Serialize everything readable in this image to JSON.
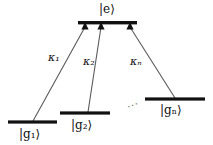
{
  "figure": {
    "type": "energy-level-diagram",
    "background_color": "#ffffff",
    "line_color": "#555555",
    "level_color": "#111111",
    "text_color": "#0d0d0d"
  },
  "levels": [
    {
      "id": "excited",
      "label_prefix": "|",
      "label_symbol": "e",
      "label_sub": "",
      "label_suffix": "⟩",
      "label_text": "|e⟩",
      "x1": 78,
      "x2": 137,
      "y": 23,
      "label_x": 99,
      "label_y": 4
    },
    {
      "id": "ground-1",
      "label_prefix": "|",
      "label_symbol": "g",
      "label_sub": "1",
      "label_suffix": "⟩",
      "label_text": "|g₁⟩",
      "x1": 8,
      "x2": 57,
      "y": 122,
      "label_x": 19,
      "label_y": 128
    },
    {
      "id": "ground-2",
      "label_prefix": "|",
      "label_symbol": "g",
      "label_sub": "2",
      "label_suffix": "⟩",
      "label_text": "|g₂⟩",
      "x1": 60,
      "x2": 110,
      "y": 113,
      "label_x": 71,
      "label_y": 119
    },
    {
      "id": "ground-n",
      "label_prefix": "|",
      "label_symbol": "g",
      "label_sub": "n",
      "label_suffix": "⟩",
      "label_text": "|gₙ⟩",
      "x1": 145,
      "x2": 205,
      "y": 99,
      "label_x": 160,
      "label_y": 104
    }
  ],
  "transitions": [
    {
      "id": "transition-1",
      "from_level": "ground-1",
      "to_level": "excited",
      "x1": 33,
      "y1": 121,
      "x2": 85,
      "y2": 26,
      "coupling_label": "κ",
      "coupling_sub": "1",
      "coupling_text": "κ₁",
      "label_x": 48,
      "label_y": 52
    },
    {
      "id": "transition-2",
      "from_level": "ground-2",
      "to_level": "excited",
      "x1": 88,
      "y1": 112,
      "x2": 101,
      "y2": 26,
      "coupling_label": "κ",
      "coupling_sub": "2",
      "coupling_text": "κ₂",
      "label_x": 83,
      "label_y": 56
    },
    {
      "id": "transition-n",
      "from_level": "ground-n",
      "to_level": "excited",
      "x1": 175,
      "y1": 98,
      "x2": 130,
      "y2": 26,
      "coupling_label": "κ",
      "coupling_sub": "n",
      "coupling_text": "κₙ",
      "label_x": 130,
      "label_y": 56
    }
  ],
  "ellipsis": {
    "text": "···",
    "x": 127,
    "y": 100
  }
}
